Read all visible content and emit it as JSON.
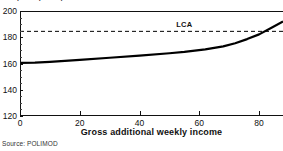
{
  "figure": {
    "clipped_title_fragment": "per capita equivalised income",
    "source_note": "Source: POLIMOD"
  },
  "chart_data": {
    "type": "line",
    "title": "",
    "xlabel": "Gross additional weekly income",
    "ylabel": "",
    "xlim": [
      0,
      88
    ],
    "ylim": [
      120,
      200
    ],
    "xticks": [
      0,
      20,
      40,
      60,
      80
    ],
    "xticklabels": [
      "0",
      "20",
      "40",
      "60",
      "80"
    ],
    "yticks": [
      120,
      140,
      160,
      180,
      200
    ],
    "yticklabels": [
      "120",
      "140",
      "160",
      "180",
      "200"
    ],
    "grid": false,
    "legend_position": "none",
    "series": [
      {
        "name": "net income",
        "style": "solid",
        "color": "#000000",
        "linewidth": 2.2,
        "x": [
          0,
          5,
          10,
          20,
          30,
          40,
          50,
          55,
          62,
          68,
          72,
          76,
          80,
          84,
          88
        ],
        "y": [
          160.5,
          160.6,
          161.2,
          162.8,
          164.4,
          166.0,
          167.8,
          168.8,
          170.8,
          173.0,
          175.4,
          178.6,
          182.2,
          187.0,
          192.0
        ]
      }
    ],
    "reference_lines": [
      {
        "name": "LCA",
        "label": "LCA",
        "value": 184.5,
        "orientation": "horizontal",
        "style": "dashed",
        "color": "#000000",
        "label_x": 55
      }
    ],
    "annotations": [],
    "axis_frame": "open-right"
  }
}
